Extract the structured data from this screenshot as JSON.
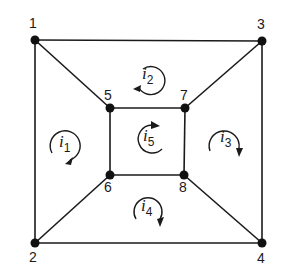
{
  "diagram": {
    "type": "circuit-graph",
    "nodes": [
      {
        "id": "1",
        "label": "1",
        "x": 35,
        "y": 40
      },
      {
        "id": "2",
        "label": "2",
        "x": 35,
        "y": 243
      },
      {
        "id": "3",
        "label": "3",
        "x": 262,
        "y": 41
      },
      {
        "id": "4",
        "label": "4",
        "x": 262,
        "y": 243
      },
      {
        "id": "5",
        "label": "5",
        "x": 110,
        "y": 108
      },
      {
        "id": "6",
        "label": "6",
        "x": 110,
        "y": 175
      },
      {
        "id": "7",
        "label": "7",
        "x": 185,
        "y": 108
      },
      {
        "id": "8",
        "label": "8",
        "x": 184,
        "y": 175
      }
    ],
    "edges": [
      [
        "1",
        "3"
      ],
      [
        "1",
        "2"
      ],
      [
        "3",
        "4"
      ],
      [
        "2",
        "4"
      ],
      [
        "1",
        "5"
      ],
      [
        "3",
        "7"
      ],
      [
        "2",
        "6"
      ],
      [
        "4",
        "8"
      ],
      [
        "5",
        "7"
      ],
      [
        "5",
        "6"
      ],
      [
        "7",
        "8"
      ],
      [
        "6",
        "8"
      ]
    ],
    "loops": [
      {
        "id": "i1",
        "symbol": "i",
        "subscript": "1",
        "direction": "clockwise"
      },
      {
        "id": "i2",
        "symbol": "i",
        "subscript": "2",
        "direction": "counterclockwise"
      },
      {
        "id": "i3",
        "symbol": "i",
        "subscript": "3",
        "direction": "clockwise"
      },
      {
        "id": "i4",
        "symbol": "i",
        "subscript": "4",
        "direction": "clockwise"
      },
      {
        "id": "i5",
        "symbol": "i",
        "subscript": "5",
        "direction": "clockwise"
      }
    ]
  }
}
